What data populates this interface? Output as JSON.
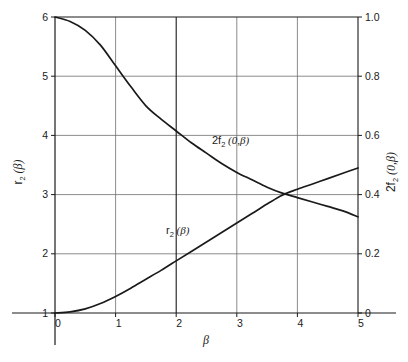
{
  "chart_data": {
    "type": "line",
    "title": "",
    "xlabel": "β",
    "ylabel_left": "r₂ (β)",
    "ylabel_right": "2f₂ (0,β)",
    "xlim": [
      0,
      5
    ],
    "ylim_left": [
      1,
      6
    ],
    "ylim_right": [
      0,
      1.0
    ],
    "grid": true,
    "legend": "inline-annotations",
    "xticks": [
      "0",
      "1",
      "2",
      "3",
      "4",
      "5"
    ],
    "xtick_values": [
      0,
      1,
      2,
      3,
      4,
      5
    ],
    "yticks_left": [
      "6",
      "5",
      "4",
      "3",
      "2",
      "1"
    ],
    "ytick_left_values": [
      6,
      5,
      4,
      3,
      2,
      1
    ],
    "yticks_right": [
      "1.0",
      "0.8",
      "0.6",
      "0.4",
      "0.2",
      "0"
    ],
    "ytick_right_values": [
      1.0,
      0.8,
      0.6,
      0.4,
      0.2,
      0
    ],
    "x": [
      0,
      0.25,
      0.5,
      0.75,
      1,
      1.25,
      1.5,
      1.75,
      2,
      2.25,
      2.5,
      2.75,
      3,
      3.25,
      3.5,
      3.75,
      4,
      4.25,
      4.5,
      4.75,
      5
    ],
    "series": [
      {
        "name": "2f₂ (0,β)",
        "axis": "right",
        "label_text": "2f₂ (0,β)",
        "values": [
          1.0,
          0.985,
          0.955,
          0.905,
          0.835,
          0.765,
          0.7,
          0.655,
          0.615,
          0.575,
          0.54,
          0.505,
          0.475,
          0.45,
          0.425,
          0.405,
          0.39,
          0.375,
          0.36,
          0.345,
          0.325
        ]
      },
      {
        "name": "r₂ (β)",
        "axis": "left",
        "label_text": "r₂ (β)",
        "values": [
          1.0,
          1.02,
          1.07,
          1.16,
          1.28,
          1.42,
          1.57,
          1.72,
          1.88,
          2.04,
          2.2,
          2.36,
          2.52,
          2.68,
          2.84,
          2.99,
          3.09,
          3.18,
          3.27,
          3.36,
          3.45
        ]
      }
    ],
    "annotations": [
      {
        "name": "curve-label-2f2",
        "text": "2f₂ (0,β)",
        "x": 2.6,
        "y_right": 0.565
      },
      {
        "name": "curve-label-r2",
        "text": "r₂ (β)",
        "x": 2.1,
        "y_left": 2.42
      }
    ],
    "intersection": {
      "x": 4.1,
      "y_left": 3.0,
      "y_right": 0.385
    },
    "colors": {
      "curve": "#1a1a1a",
      "grid": "#6e6e6e",
      "axis": "#1a1a1a",
      "background": "#ffffff"
    }
  },
  "labels": {
    "x_axis": "β",
    "y_axis_left_main": "r",
    "y_axis_left_sub": "2",
    "y_axis_left_tail": "(β)",
    "y_axis_right_main": "2f",
    "y_axis_right_sub": "2",
    "y_axis_right_tail": "(0,β)",
    "curve_a_main": "2f",
    "curve_a_sub": "2",
    "curve_a_tail": "(0,β)",
    "curve_b_main": "r",
    "curve_b_sub": "2",
    "curve_b_tail": "(β)"
  },
  "ticks": {
    "x": [
      "0",
      "1",
      "2",
      "3",
      "4",
      "5"
    ],
    "left": [
      "6",
      "5",
      "4",
      "3",
      "2",
      "1"
    ],
    "right": [
      "1.0",
      "0.8",
      "0.6",
      "0.4",
      "0.2",
      "0"
    ]
  }
}
